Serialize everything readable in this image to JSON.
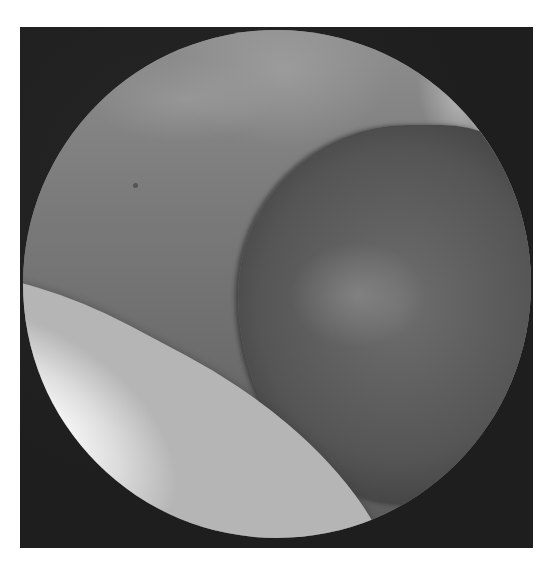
{
  "image": {
    "kind": "grayscale arthroscopic endoscope view",
    "description": "Circular endoscopic field of view on a dark square frame showing a bright white structure along the lower left, a rounded darker tissue mass at center-right, and light glare along the upper right rim.",
    "colors": {
      "frame": "#1e1e1e",
      "background": "#ffffff",
      "tissue_mid": "#7c7c7c",
      "bulge_dark": "#555555",
      "bright_structure": "#f2f2f2"
    }
  }
}
